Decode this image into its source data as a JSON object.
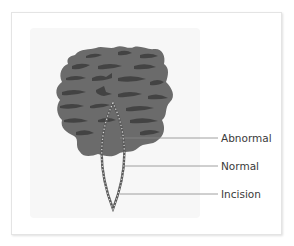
{
  "figure": {
    "labels": [
      {
        "id": "abnormal",
        "text": "Abnormal"
      },
      {
        "id": "normal",
        "text": "Normal"
      },
      {
        "id": "incision",
        "text": "Incision"
      }
    ],
    "colors": {
      "lesion_base": "#6b6b6b",
      "lesion_stripes": "#3f3f3f",
      "incision_outline": "#5a5a5a",
      "incision_dots": "#d9d9d9",
      "leader_lines": "#888888",
      "label_text": "#3a3a3a",
      "frame_border": "#e4e4e4",
      "panel_bg": "#f7f7f7"
    }
  }
}
